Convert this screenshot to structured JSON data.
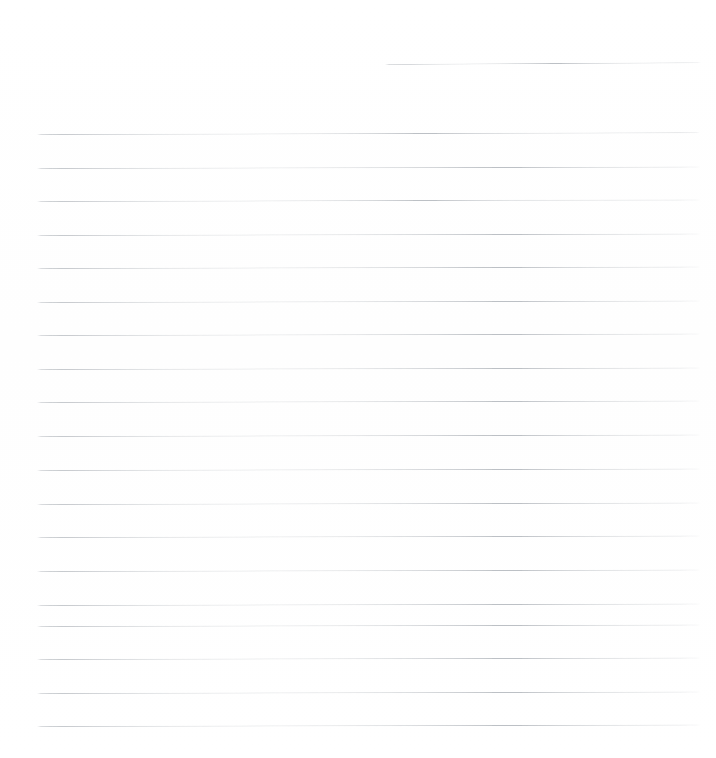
{
  "document": {
    "kind": "blank-lined-paper-scan",
    "page_label": "",
    "background_color": "#ffffff",
    "rule_color": "#b9bdc2",
    "page_width": 716,
    "page_height": 758,
    "visible_text": "",
    "handwriting_present": "no",
    "note": ""
  },
  "ruling": {
    "line_count": 21,
    "full_width_line_count": 20,
    "partial_line_count": 1,
    "line_spacing_px": 33.3,
    "left_margin_px": 37,
    "right_edge_px": 700,
    "first_full_line_y": 134,
    "last_full_line_y": 726,
    "slant_deg": -0.12
  },
  "lines": [
    {
      "id": "line-header",
      "y": 63.5,
      "x": 385,
      "width": 316,
      "partial": true,
      "slant": -0.3
    },
    {
      "id": "line-01",
      "y": 134.0,
      "x": 37,
      "width": 663,
      "partial": false,
      "slant": -0.15
    },
    {
      "id": "line-02",
      "y": 167.5,
      "x": 37,
      "width": 663,
      "partial": false,
      "slant": -0.13
    },
    {
      "id": "line-03",
      "y": 201.0,
      "x": 37,
      "width": 663,
      "partial": false,
      "slant": -0.14
    },
    {
      "id": "line-04",
      "y": 234.5,
      "x": 37,
      "width": 663,
      "partial": false,
      "slant": -0.12
    },
    {
      "id": "line-05",
      "y": 268.0,
      "x": 37,
      "width": 663,
      "partial": false,
      "slant": -0.13
    },
    {
      "id": "line-06",
      "y": 301.5,
      "x": 37,
      "width": 663,
      "partial": false,
      "slant": -0.12
    },
    {
      "id": "line-07",
      "y": 335.0,
      "x": 37,
      "width": 663,
      "partial": false,
      "slant": -0.13
    },
    {
      "id": "line-08",
      "y": 368.5,
      "x": 37,
      "width": 663,
      "partial": false,
      "slant": -0.12
    },
    {
      "id": "line-09",
      "y": 402.0,
      "x": 37,
      "width": 663,
      "partial": false,
      "slant": -0.12
    },
    {
      "id": "line-10",
      "y": 436.0,
      "x": 37,
      "width": 663,
      "partial": false,
      "slant": -0.13
    },
    {
      "id": "line-11",
      "y": 469.5,
      "x": 37,
      "width": 663,
      "partial": false,
      "slant": -0.12
    },
    {
      "id": "line-12",
      "y": 503.5,
      "x": 37,
      "width": 663,
      "partial": false,
      "slant": -0.12
    },
    {
      "id": "line-13",
      "y": 537.0,
      "x": 37,
      "width": 663,
      "partial": false,
      "slant": -0.12
    },
    {
      "id": "line-14",
      "y": 570.5,
      "x": 37,
      "width": 663,
      "partial": false,
      "slant": -0.12
    },
    {
      "id": "line-15",
      "y": 604.5,
      "x": 37,
      "width": 663,
      "partial": false,
      "slant": -0.12
    },
    {
      "id": "line-16",
      "y": 625.5,
      "x": 37,
      "width": 663,
      "partial": false,
      "slant": -0.12
    },
    {
      "id": "line-17",
      "y": 659.0,
      "x": 37,
      "width": 663,
      "partial": false,
      "slant": -0.12
    },
    {
      "id": "line-18",
      "y": 692.5,
      "x": 37,
      "width": 663,
      "partial": false,
      "slant": -0.12
    },
    {
      "id": "line-19",
      "y": 726.0,
      "x": 37,
      "width": 663,
      "partial": false,
      "slant": -0.12
    }
  ]
}
